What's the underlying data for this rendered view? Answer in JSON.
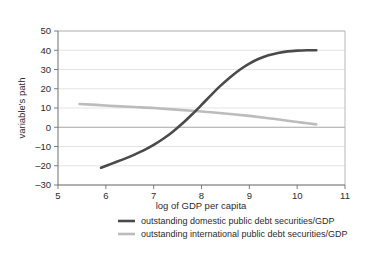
{
  "figure": {
    "background_color": "#ffffff",
    "plot_background_color": "#ffffff",
    "frame_color": "#b9b9b9",
    "grid_color": "#d8d8d8",
    "text_color": "#2b2b2b"
  },
  "chart_data": {
    "type": "line",
    "title": "",
    "xlabel": "log of GDP per capita",
    "ylabel": "variable's path",
    "xlim": [
      5,
      11
    ],
    "ylim": [
      -30,
      50
    ],
    "xticks": [
      5,
      6,
      7,
      8,
      9,
      10,
      11
    ],
    "xtick_labels": [
      "5",
      "6",
      "7",
      "8",
      "9",
      "10",
      "11"
    ],
    "yticks": [
      -30,
      -20,
      -10,
      0,
      10,
      20,
      30,
      40,
      50
    ],
    "ytick_labels": [
      "–30",
      "–20",
      "–10",
      "0",
      "10",
      "20",
      "30",
      "40",
      "50"
    ],
    "grid": "horizontal",
    "legend_position": "bottom",
    "series": [
      {
        "name": "outstanding domestic public debt securities/GDP",
        "color": "#4a4a4a",
        "width": 2.6,
        "x": [
          5.9,
          6.05,
          6.2,
          6.4,
          6.6,
          6.8,
          7.0,
          7.2,
          7.4,
          7.6,
          7.8,
          8.0,
          8.2,
          8.4,
          8.6,
          8.8,
          9.0,
          9.2,
          9.4,
          9.6,
          9.8,
          10.0,
          10.2,
          10.4
        ],
        "values": [
          -21.0,
          -19.6,
          -18.2,
          -16.3,
          -14.2,
          -11.9,
          -9.2,
          -6.0,
          -2.3,
          1.9,
          6.6,
          11.6,
          16.7,
          21.6,
          26.0,
          29.9,
          33.1,
          35.6,
          37.4,
          38.6,
          39.4,
          39.8,
          40.0,
          40.0
        ]
      },
      {
        "name": "outstanding international public debt securities/GDP",
        "color": "#bcbcbc",
        "width": 2.6,
        "x": [
          5.45,
          5.8,
          6.2,
          6.6,
          7.0,
          7.4,
          7.8,
          8.2,
          8.6,
          9.0,
          9.4,
          9.8,
          10.1,
          10.4
        ],
        "values": [
          12.1,
          11.6,
          11.0,
          10.5,
          10.0,
          9.3,
          8.6,
          7.8,
          6.9,
          5.9,
          4.7,
          3.4,
          2.4,
          1.5
        ]
      }
    ],
    "zero_line": 0
  },
  "legend": {
    "entries": [
      {
        "label": "outstanding domestic public debt securities/GDP",
        "color": "#4a4a4a"
      },
      {
        "label": "outstanding international public debt securities/GDP",
        "color": "#bcbcbc"
      }
    ]
  }
}
